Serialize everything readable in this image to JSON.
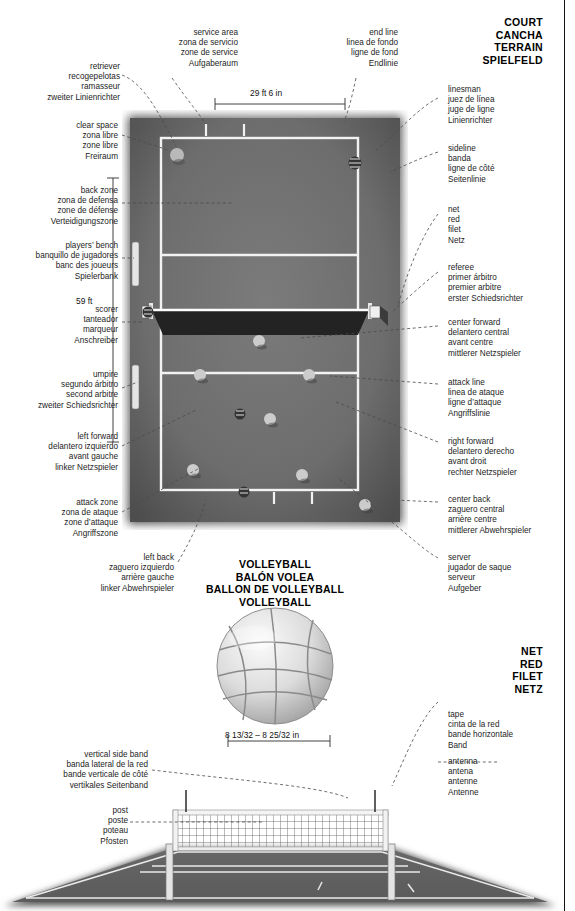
{
  "sections": {
    "court": {
      "lines": [
        "COURT",
        "CANCHA",
        "TERRAIN",
        "SPIELFELD"
      ]
    },
    "net": {
      "lines": [
        "NET",
        "RED",
        "FILET",
        "NETZ"
      ]
    },
    "ball": {
      "lines": [
        "VOLLEYBALL",
        "BALÓN VOLEA",
        "BALLON DE VOLLEYBALL",
        "VOLLEYBALL"
      ]
    }
  },
  "dimensions": {
    "court_width": "29 ft 6 in",
    "court_length": "59 ft",
    "ball_diameter": "8 13/32 – 8 25/32 in"
  },
  "labels": {
    "service_area": {
      "en": "service area",
      "es": "zona de servicio",
      "fr": "zone de service",
      "de": "Aufgaberaum"
    },
    "end_line": {
      "en": "end line",
      "es": "linea de fondo",
      "fr": "ligne de fond",
      "de": "Endlinie"
    },
    "retriever": {
      "en": "retriever",
      "es": "recogepelotas",
      "fr": "ramasseur",
      "de": "zweiter Linienrichter"
    },
    "clear_space": {
      "en": "clear space",
      "es": "zona libre",
      "fr": "zone libre",
      "de": "Freiraum"
    },
    "back_zone": {
      "en": "back zone",
      "es": "zona de defensa",
      "fr": "zone de défense",
      "de": "Verteidigungszone"
    },
    "players_bench": {
      "en": "players’ bench",
      "es": "banquillo de jugadores",
      "fr": "banc des joueurs",
      "de": "Spielerbank"
    },
    "scorer": {
      "en": "scorer",
      "es": "tanteador",
      "fr": "marqueur",
      "de": "Anschreiber"
    },
    "umpire": {
      "en": "umpire",
      "es": "segundo árbitro",
      "fr": "second arbitre",
      "de": "zweiter Schiedsrichter"
    },
    "left_forward": {
      "en": "left forward",
      "es": "delantero izquierdo",
      "fr": "avant gauche",
      "de": "linker Netzspieler"
    },
    "attack_zone": {
      "en": "attack zone",
      "es": "zona de ataque",
      "fr": "zone d’attaque",
      "de": "Angriffszone"
    },
    "left_back": {
      "en": "left back",
      "es": "zaguero izquierdo",
      "fr": "arrière gauche",
      "de": "linker Abwehrspieler"
    },
    "linesman": {
      "en": "linesman",
      "es": "juez de línea",
      "fr": "juge de ligne",
      "de": "Linienrichter"
    },
    "sideline": {
      "en": "sideline",
      "es": "banda",
      "fr": "ligne de côté",
      "de": "Seitenlinie"
    },
    "net": {
      "en": "net",
      "es": "red",
      "fr": "filet",
      "de": "Netz"
    },
    "referee": {
      "en": "referee",
      "es": "primer árbitro",
      "fr": "premier arbitre",
      "de": "erster Schiedsrichter"
    },
    "center_forward": {
      "en": "center forward",
      "es": "delantero central",
      "fr": "avant centre",
      "de": "mittlerer Netzspieler"
    },
    "attack_line": {
      "en": "attack line",
      "es": "linea de ataque",
      "fr": "ligne d’attaque",
      "de": "Angriffslinie"
    },
    "right_forward": {
      "en": "right forward",
      "es": "delantero derecho",
      "fr": "avant droit",
      "de": "rechter Netzspieler"
    },
    "center_back": {
      "en": "center back",
      "es": "zaguero central",
      "fr": "arrière centre",
      "de": "mittlerer Abwehrspieler"
    },
    "server": {
      "en": "server",
      "es": "jugador de saque",
      "fr": "serveur",
      "de": "Aufgeber"
    },
    "tape": {
      "en": "tape",
      "es": "cinta de la red",
      "fr": "bande horizontale",
      "de": "Band"
    },
    "antenna": {
      "en": "antenna",
      "es": "antena",
      "fr": "antenne",
      "de": "Antenne"
    },
    "vertical_side_band": {
      "en": "vertical side band",
      "es": "banda lateral de la red",
      "fr": "bande verticale de côté",
      "de": "vertikales Seitenband"
    },
    "post": {
      "en": "post",
      "es": "poste",
      "fr": "poteau",
      "de": "Pfosten"
    }
  },
  "colors": {
    "court_surface": "#6e6e6e",
    "court_line": "#f2f2f2",
    "net_band": "#2a2a2a",
    "player": "#c9c9c9",
    "official": "#3a3a3a",
    "text": "#1d1d1d"
  }
}
